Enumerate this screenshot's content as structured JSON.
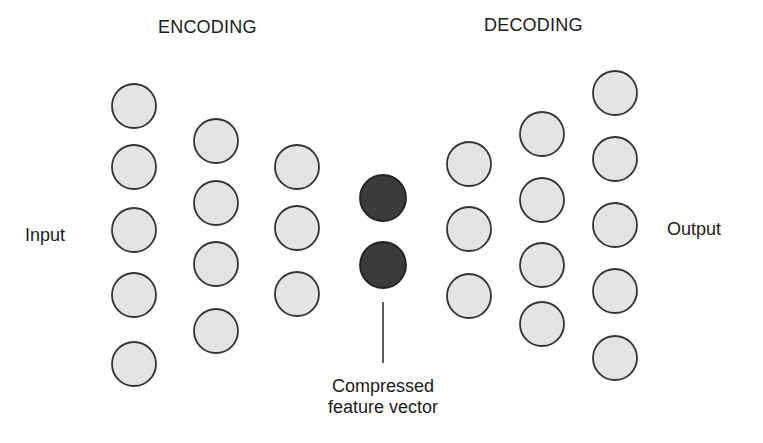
{
  "labels": {
    "encoding": "ENCODING",
    "decoding": "DECODING",
    "input": "Input",
    "output": "Output",
    "compressed_line1": "Compressed",
    "compressed_line2": "feature vector"
  },
  "colors": {
    "node_fill": "#e4e4e4",
    "node_stroke": "#333333",
    "bottleneck_fill": "#3b3b3b"
  },
  "network": {
    "layers": [
      {
        "name": "input-layer",
        "role": "encoder",
        "nodes": 5,
        "type": "light"
      },
      {
        "name": "encoder-hidden-1",
        "role": "encoder",
        "nodes": 4,
        "type": "light"
      },
      {
        "name": "encoder-hidden-2",
        "role": "encoder",
        "nodes": 3,
        "type": "light"
      },
      {
        "name": "bottleneck",
        "role": "compressed",
        "nodes": 2,
        "type": "dark"
      },
      {
        "name": "decoder-hidden-1",
        "role": "decoder",
        "nodes": 3,
        "type": "light"
      },
      {
        "name": "decoder-hidden-2",
        "role": "decoder",
        "nodes": 4,
        "type": "light"
      },
      {
        "name": "output-layer",
        "role": "decoder",
        "nodes": 5,
        "type": "light"
      }
    ]
  }
}
